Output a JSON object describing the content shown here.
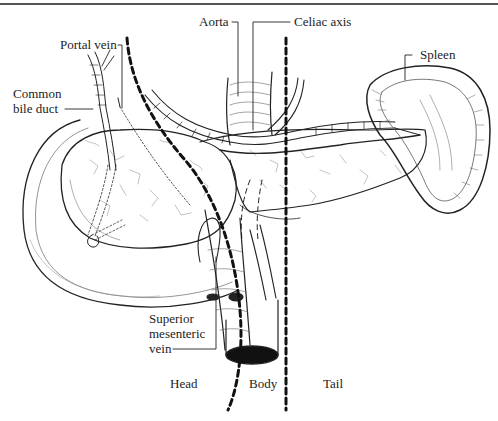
{
  "figure": {
    "labels": {
      "aorta": "Aorta",
      "celiac_axis": "Celiac axis",
      "portal_vein": "Portal vein",
      "common_bile_duct_line1": "Common",
      "common_bile_duct_line2": "bile duct",
      "spleen": "Spleen",
      "smv_line1": "Superior",
      "smv_line2": "mesenteric",
      "smv_line3": "vein",
      "head": "Head",
      "body": "Body",
      "tail": "Tail"
    },
    "regions": [
      "Head",
      "Body",
      "Tail"
    ],
    "divider_style": "thick dashed black lines",
    "colors": {
      "ink": "#222222",
      "background": "#ffffff",
      "rule": "#555555"
    }
  }
}
